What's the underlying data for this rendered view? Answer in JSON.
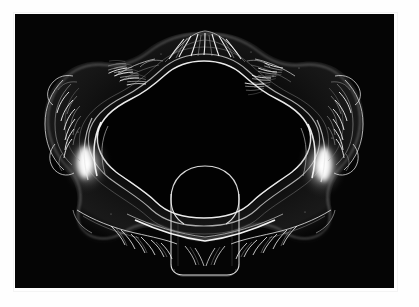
{
  "page": {
    "background_color": "#ffffff",
    "margin_color": "#fefefe"
  },
  "photograph": {
    "title": "Ornate cut-glass dish",
    "caption": "",
    "medium": "black and white photograph",
    "background_color": "#050505",
    "subject_name": "rococo-scrollwork-glass-tray",
    "lighting": "dark-field rim lighting",
    "frame": {
      "x": 15,
      "y": 14,
      "width": 379,
      "height": 274,
      "border_color": "#f4f4f4"
    },
    "highlight_color": "#ffffff",
    "midtone_color": "#9a9a9a",
    "shadow_color": "#0a0a0a",
    "features": [
      {
        "name": "top-crest-shell-ornament",
        "position": "top-center"
      },
      {
        "name": "left-acanthus-scrollwork",
        "position": "left-edge"
      },
      {
        "name": "right-acanthus-scrollwork",
        "position": "right-edge"
      },
      {
        "name": "left-rim-specular-highlight",
        "position": "left-inner-rim"
      },
      {
        "name": "right-rim-specular-highlight",
        "position": "right-inner-rim"
      },
      {
        "name": "inner-well",
        "position": "center"
      },
      {
        "name": "bottom-handle-tab",
        "position": "bottom-center"
      },
      {
        "name": "bottom-feather-ornaments",
        "position": "bottom"
      }
    ]
  }
}
